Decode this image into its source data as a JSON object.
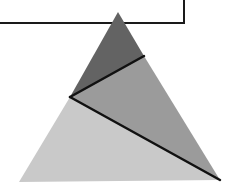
{
  "diagram": {
    "box": {
      "x1": 0,
      "y1": 0,
      "x2": 184,
      "y2": 23,
      "stroke": "#1a1a1a"
    },
    "triangle": {
      "apex": [
        118,
        12
      ],
      "bottom_left": [
        19,
        182
      ],
      "bottom_right": [
        220,
        180
      ]
    },
    "division_points": {
      "left_side_point": [
        70,
        97
      ],
      "right_side_point": [
        144,
        56
      ]
    },
    "regions": [
      {
        "name": "top-region",
        "fill": "#636363"
      },
      {
        "name": "middle-region",
        "fill": "#9b9b9b"
      },
      {
        "name": "bottom-region",
        "fill": "#c9c9c9"
      }
    ],
    "line_color": "#111111"
  }
}
